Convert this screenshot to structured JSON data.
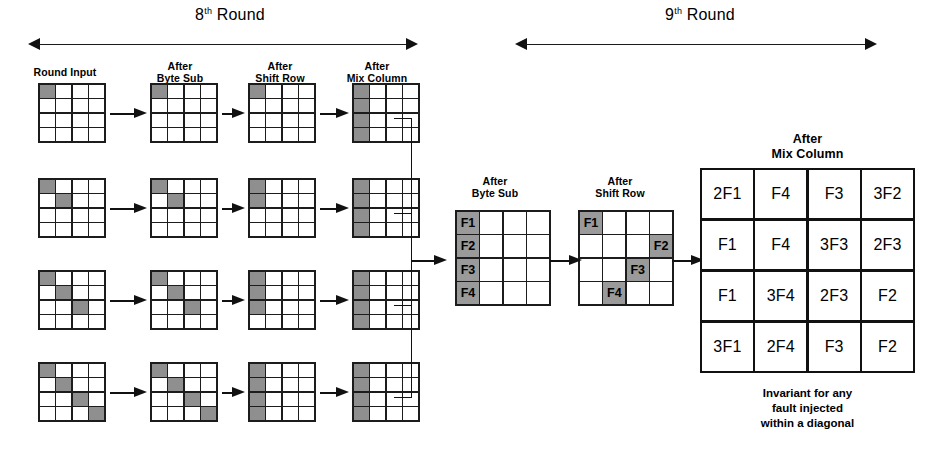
{
  "figure": {
    "shade_color": "#8f8f8f",
    "line_color": "#111111",
    "background": "#ffffff"
  },
  "rounds": [
    {
      "id": "round8",
      "label_prefix": "8",
      "label_sup": "th",
      "label_suffix": "Round"
    },
    {
      "id": "round9",
      "label_prefix": "9",
      "label_sup": "th",
      "label_suffix": "Round"
    }
  ],
  "round8": {
    "columns": [
      {
        "id": "round-input",
        "line1": "Round Input",
        "line2": ""
      },
      {
        "id": "after-byte-sub",
        "line1": "After",
        "line2": "Byte Sub"
      },
      {
        "id": "after-shift-row",
        "line1": "After",
        "line2": "Shift Row"
      },
      {
        "id": "after-mix-column",
        "line1": "After",
        "line2": "Mix Column"
      }
    ],
    "rows": [
      {
        "id": "row-1",
        "round_input": [
          [
            1,
            0,
            0,
            0
          ],
          [
            0,
            0,
            0,
            0
          ],
          [
            0,
            0,
            0,
            0
          ],
          [
            0,
            0,
            0,
            0
          ]
        ],
        "after_byte_sub": [
          [
            1,
            0,
            0,
            0
          ],
          [
            0,
            0,
            0,
            0
          ],
          [
            0,
            0,
            0,
            0
          ],
          [
            0,
            0,
            0,
            0
          ]
        ],
        "after_shift_row": [
          [
            1,
            0,
            0,
            0
          ],
          [
            0,
            0,
            0,
            0
          ],
          [
            0,
            0,
            0,
            0
          ],
          [
            0,
            0,
            0,
            0
          ]
        ],
        "after_mix_column": [
          [
            1,
            0,
            0,
            0
          ],
          [
            1,
            0,
            0,
            0
          ],
          [
            1,
            0,
            0,
            0
          ],
          [
            1,
            0,
            0,
            0
          ]
        ]
      },
      {
        "id": "row-2",
        "round_input": [
          [
            1,
            0,
            0,
            0
          ],
          [
            0,
            1,
            0,
            0
          ],
          [
            0,
            0,
            0,
            0
          ],
          [
            0,
            0,
            0,
            0
          ]
        ],
        "after_byte_sub": [
          [
            1,
            0,
            0,
            0
          ],
          [
            0,
            1,
            0,
            0
          ],
          [
            0,
            0,
            0,
            0
          ],
          [
            0,
            0,
            0,
            0
          ]
        ],
        "after_shift_row": [
          [
            1,
            0,
            0,
            0
          ],
          [
            1,
            0,
            0,
            0
          ],
          [
            0,
            0,
            0,
            0
          ],
          [
            0,
            0,
            0,
            0
          ]
        ],
        "after_mix_column": [
          [
            1,
            0,
            0,
            0
          ],
          [
            1,
            0,
            0,
            0
          ],
          [
            1,
            0,
            0,
            0
          ],
          [
            1,
            0,
            0,
            0
          ]
        ]
      },
      {
        "id": "row-3",
        "round_input": [
          [
            1,
            0,
            0,
            0
          ],
          [
            0,
            1,
            0,
            0
          ],
          [
            0,
            0,
            1,
            0
          ],
          [
            0,
            0,
            0,
            0
          ]
        ],
        "after_byte_sub": [
          [
            1,
            0,
            0,
            0
          ],
          [
            0,
            1,
            0,
            0
          ],
          [
            0,
            0,
            1,
            0
          ],
          [
            0,
            0,
            0,
            0
          ]
        ],
        "after_shift_row": [
          [
            1,
            0,
            0,
            0
          ],
          [
            1,
            0,
            0,
            0
          ],
          [
            1,
            0,
            0,
            0
          ],
          [
            0,
            0,
            0,
            0
          ]
        ],
        "after_mix_column": [
          [
            1,
            0,
            0,
            0
          ],
          [
            1,
            0,
            0,
            0
          ],
          [
            1,
            0,
            0,
            0
          ],
          [
            1,
            0,
            0,
            0
          ]
        ]
      },
      {
        "id": "row-4",
        "round_input": [
          [
            1,
            0,
            0,
            0
          ],
          [
            0,
            1,
            0,
            0
          ],
          [
            0,
            0,
            1,
            0
          ],
          [
            0,
            0,
            0,
            1
          ]
        ],
        "after_byte_sub": [
          [
            1,
            0,
            0,
            0
          ],
          [
            0,
            1,
            0,
            0
          ],
          [
            0,
            0,
            1,
            0
          ],
          [
            0,
            0,
            0,
            1
          ]
        ],
        "after_shift_row": [
          [
            1,
            0,
            0,
            0
          ],
          [
            1,
            0,
            0,
            0
          ],
          [
            1,
            0,
            0,
            0
          ],
          [
            1,
            0,
            0,
            0
          ]
        ],
        "after_mix_column": [
          [
            1,
            0,
            0,
            0
          ],
          [
            1,
            0,
            0,
            0
          ],
          [
            1,
            0,
            0,
            0
          ],
          [
            1,
            0,
            0,
            0
          ]
        ]
      }
    ]
  },
  "round9": {
    "columns": [
      {
        "id": "after-byte-sub",
        "line1": "After",
        "line2": "Byte Sub"
      },
      {
        "id": "after-shift-row",
        "line1": "After",
        "line2": "Shift Row"
      },
      {
        "id": "after-mix-column",
        "line1": "After",
        "line2": "Mix Column"
      }
    ],
    "after_byte_sub": {
      "labels": [
        [
          "F1",
          "",
          "",
          ""
        ],
        [
          "F2",
          "",
          "",
          ""
        ],
        [
          "F3",
          "",
          "",
          ""
        ],
        [
          "F4",
          "",
          "",
          ""
        ]
      ],
      "shaded": [
        [
          1,
          0,
          0,
          0
        ],
        [
          1,
          0,
          0,
          0
        ],
        [
          1,
          0,
          0,
          0
        ],
        [
          1,
          0,
          0,
          0
        ]
      ]
    },
    "after_shift_row": {
      "labels": [
        [
          "F1",
          "",
          "",
          ""
        ],
        [
          "",
          "",
          "",
          "F2"
        ],
        [
          "",
          "",
          "F3",
          ""
        ],
        [
          "",
          "F4",
          "",
          ""
        ]
      ],
      "shaded": [
        [
          1,
          0,
          0,
          0
        ],
        [
          0,
          0,
          0,
          1
        ],
        [
          0,
          0,
          1,
          0
        ],
        [
          0,
          1,
          0,
          0
        ]
      ]
    },
    "after_mix_column": {
      "rows": [
        [
          "2F1",
          "F4",
          "F3",
          "3F2"
        ],
        [
          "F1",
          "F4",
          "3F3",
          "2F3"
        ],
        [
          "F1",
          "3F4",
          "2F3",
          "F2"
        ],
        [
          "3F1",
          "2F4",
          "F3",
          "F2"
        ]
      ]
    },
    "footnote": {
      "line1": "Invariant for any",
      "line2": "fault injected",
      "line3": "within a diagonal"
    }
  }
}
